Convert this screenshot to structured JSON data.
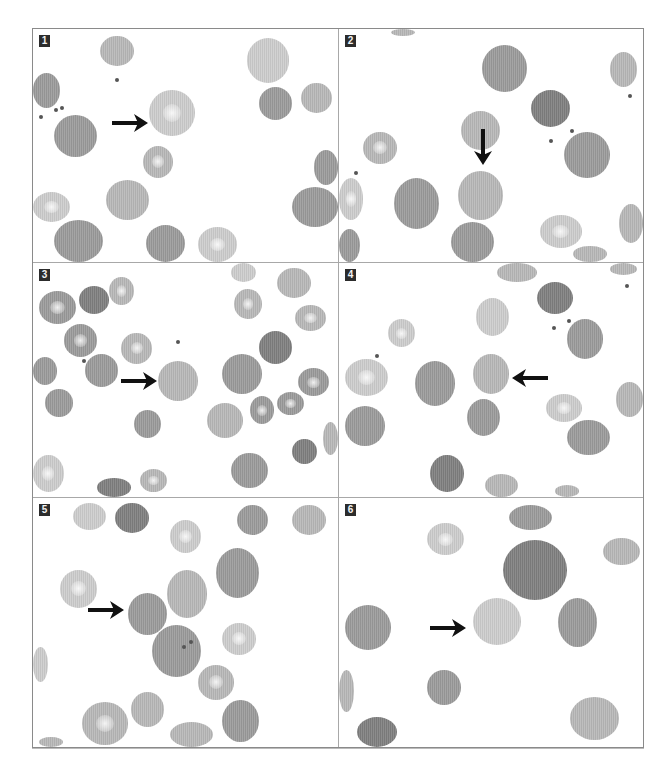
{
  "figure": {
    "panels": [
      {
        "label": "1",
        "arrow": {
          "direction": "right",
          "x": 26,
          "y": 36
        },
        "cells": [
          {
            "x": 22,
            "y": 3,
            "w": 11,
            "h": 13,
            "tone": "c-light"
          },
          {
            "x": 0,
            "y": 19,
            "w": 9,
            "h": 15,
            "tone": "c-mid"
          },
          {
            "x": 7,
            "y": 37,
            "w": 14,
            "h": 18,
            "tone": "c-mid"
          },
          {
            "x": 38,
            "y": 26,
            "w": 15,
            "h": 20,
            "tone": "c-pale",
            "pallor": true
          },
          {
            "x": 36,
            "y": 50,
            "w": 10,
            "h": 14,
            "tone": "c-light",
            "pallor": true
          },
          {
            "x": 24,
            "y": 65,
            "w": 14,
            "h": 17,
            "tone": "c-light"
          },
          {
            "x": 0,
            "y": 70,
            "w": 12,
            "h": 13,
            "tone": "c-pale",
            "pallor": true
          },
          {
            "x": 7,
            "y": 82,
            "w": 16,
            "h": 18,
            "tone": "c-mid"
          },
          {
            "x": 37,
            "y": 84,
            "w": 13,
            "h": 16,
            "tone": "c-mid"
          },
          {
            "x": 54,
            "y": 85,
            "w": 13,
            "h": 15,
            "tone": "c-pale",
            "pallor": true
          },
          {
            "x": 70,
            "y": 4,
            "w": 14,
            "h": 19,
            "tone": "c-pale"
          },
          {
            "x": 74,
            "y": 25,
            "w": 11,
            "h": 14,
            "tone": "c-mid"
          },
          {
            "x": 88,
            "y": 23,
            "w": 10,
            "h": 13,
            "tone": "c-light"
          },
          {
            "x": 92,
            "y": 52,
            "w": 8,
            "h": 15,
            "tone": "c-mid"
          },
          {
            "x": 85,
            "y": 68,
            "w": 15,
            "h": 17,
            "tone": "c-mid"
          }
        ],
        "debris": [
          {
            "x": 27,
            "y": 21
          },
          {
            "x": 7,
            "y": 34
          },
          {
            "x": 9,
            "y": 33
          },
          {
            "x": 2,
            "y": 37
          }
        ]
      },
      {
        "label": "2",
        "arrow": {
          "direction": "down",
          "x": 44,
          "y": 43
        },
        "cells": [
          {
            "x": 17,
            "y": 0,
            "w": 8,
            "h": 3,
            "tone": "c-light"
          },
          {
            "x": 47,
            "y": 7,
            "w": 15,
            "h": 20,
            "tone": "c-mid"
          },
          {
            "x": 89,
            "y": 10,
            "w": 9,
            "h": 15,
            "tone": "c-light"
          },
          {
            "x": 63,
            "y": 26,
            "w": 13,
            "h": 16,
            "tone": "c-dark"
          },
          {
            "x": 40,
            "y": 35,
            "w": 13,
            "h": 17,
            "tone": "c-light"
          },
          {
            "x": 74,
            "y": 44,
            "w": 15,
            "h": 20,
            "tone": "c-mid"
          },
          {
            "x": 8,
            "y": 44,
            "w": 11,
            "h": 14,
            "tone": "c-light",
            "pallor": true
          },
          {
            "x": 0,
            "y": 64,
            "w": 8,
            "h": 18,
            "tone": "c-pale",
            "pallor": true
          },
          {
            "x": 18,
            "y": 64,
            "w": 15,
            "h": 22,
            "tone": "c-mid"
          },
          {
            "x": 39,
            "y": 61,
            "w": 15,
            "h": 21,
            "tone": "c-light"
          },
          {
            "x": 37,
            "y": 83,
            "w": 14,
            "h": 17,
            "tone": "c-mid"
          },
          {
            "x": 0,
            "y": 86,
            "w": 7,
            "h": 14,
            "tone": "c-mid"
          },
          {
            "x": 66,
            "y": 80,
            "w": 14,
            "h": 14,
            "tone": "c-pale",
            "pallor": true
          },
          {
            "x": 77,
            "y": 93,
            "w": 11,
            "h": 7,
            "tone": "c-light"
          },
          {
            "x": 92,
            "y": 75,
            "w": 8,
            "h": 17,
            "tone": "c-light"
          }
        ],
        "debris": [
          {
            "x": 5,
            "y": 61
          },
          {
            "x": 95,
            "y": 28
          },
          {
            "x": 76,
            "y": 43
          },
          {
            "x": 69,
            "y": 47
          }
        ]
      },
      {
        "label": "3",
        "arrow": {
          "direction": "right",
          "x": 29,
          "y": 46
        },
        "cells": [
          {
            "x": 2,
            "y": 12,
            "w": 12,
            "h": 14,
            "tone": "c-mid",
            "pallor": true
          },
          {
            "x": 15,
            "y": 10,
            "w": 10,
            "h": 12,
            "tone": "c-dark"
          },
          {
            "x": 25,
            "y": 6,
            "w": 8,
            "h": 12,
            "tone": "c-light",
            "pallor": true
          },
          {
            "x": 10,
            "y": 26,
            "w": 11,
            "h": 14,
            "tone": "c-mid",
            "pallor": true
          },
          {
            "x": 29,
            "y": 30,
            "w": 10,
            "h": 13,
            "tone": "c-light",
            "pallor": true
          },
          {
            "x": 0,
            "y": 40,
            "w": 8,
            "h": 12,
            "tone": "c-mid"
          },
          {
            "x": 17,
            "y": 39,
            "w": 11,
            "h": 14,
            "tone": "c-mid"
          },
          {
            "x": 41,
            "y": 42,
            "w": 13,
            "h": 17,
            "tone": "c-light"
          },
          {
            "x": 4,
            "y": 54,
            "w": 9,
            "h": 12,
            "tone": "c-mid"
          },
          {
            "x": 33,
            "y": 63,
            "w": 9,
            "h": 12,
            "tone": "c-mid"
          },
          {
            "x": 0,
            "y": 82,
            "w": 10,
            "h": 16,
            "tone": "c-pale",
            "pallor": true
          },
          {
            "x": 21,
            "y": 92,
            "w": 11,
            "h": 8,
            "tone": "c-dark"
          },
          {
            "x": 35,
            "y": 88,
            "w": 9,
            "h": 10,
            "tone": "c-light",
            "pallor": true
          },
          {
            "x": 65,
            "y": 0,
            "w": 8,
            "h": 8,
            "tone": "c-pale"
          },
          {
            "x": 80,
            "y": 2,
            "w": 11,
            "h": 13,
            "tone": "c-light"
          },
          {
            "x": 66,
            "y": 11,
            "w": 9,
            "h": 13,
            "tone": "c-light",
            "pallor": true
          },
          {
            "x": 86,
            "y": 18,
            "w": 10,
            "h": 11,
            "tone": "c-light",
            "pallor": true
          },
          {
            "x": 74,
            "y": 29,
            "w": 11,
            "h": 14,
            "tone": "c-dark"
          },
          {
            "x": 62,
            "y": 39,
            "w": 13,
            "h": 17,
            "tone": "c-mid"
          },
          {
            "x": 87,
            "y": 45,
            "w": 10,
            "h": 12,
            "tone": "c-mid",
            "pallor": true
          },
          {
            "x": 57,
            "y": 60,
            "w": 12,
            "h": 15,
            "tone": "c-light"
          },
          {
            "x": 71,
            "y": 57,
            "w": 8,
            "h": 12,
            "tone": "c-mid",
            "pallor": true
          },
          {
            "x": 80,
            "y": 55,
            "w": 9,
            "h": 10,
            "tone": "c-mid",
            "pallor": true
          },
          {
            "x": 85,
            "y": 75,
            "w": 8,
            "h": 11,
            "tone": "c-dark"
          },
          {
            "x": 95,
            "y": 68,
            "w": 5,
            "h": 14,
            "tone": "c-light"
          },
          {
            "x": 65,
            "y": 81,
            "w": 12,
            "h": 15,
            "tone": "c-mid"
          }
        ],
        "debris": [
          {
            "x": 16,
            "y": 41
          },
          {
            "x": 47,
            "y": 33
          }
        ]
      },
      {
        "label": "4",
        "arrow": {
          "direction": "left",
          "x": 57,
          "y": 45
        },
        "cells": [
          {
            "x": 52,
            "y": 0,
            "w": 13,
            "h": 8,
            "tone": "c-light"
          },
          {
            "x": 89,
            "y": 0,
            "w": 9,
            "h": 5,
            "tone": "c-light"
          },
          {
            "x": 65,
            "y": 8,
            "w": 12,
            "h": 14,
            "tone": "c-dark"
          },
          {
            "x": 45,
            "y": 15,
            "w": 11,
            "h": 16,
            "tone": "c-pale"
          },
          {
            "x": 16,
            "y": 24,
            "w": 9,
            "h": 12,
            "tone": "c-pale",
            "pallor": true
          },
          {
            "x": 75,
            "y": 24,
            "w": 12,
            "h": 17,
            "tone": "c-mid"
          },
          {
            "x": 2,
            "y": 41,
            "w": 14,
            "h": 16,
            "tone": "c-pale",
            "pallor": true
          },
          {
            "x": 25,
            "y": 42,
            "w": 13,
            "h": 19,
            "tone": "c-mid"
          },
          {
            "x": 44,
            "y": 39,
            "w": 12,
            "h": 17,
            "tone": "c-light"
          },
          {
            "x": 42,
            "y": 58,
            "w": 11,
            "h": 16,
            "tone": "c-mid"
          },
          {
            "x": 2,
            "y": 61,
            "w": 13,
            "h": 17,
            "tone": "c-mid"
          },
          {
            "x": 68,
            "y": 56,
            "w": 12,
            "h": 12,
            "tone": "c-pale",
            "pallor": true
          },
          {
            "x": 75,
            "y": 67,
            "w": 14,
            "h": 15,
            "tone": "c-mid"
          },
          {
            "x": 91,
            "y": 51,
            "w": 9,
            "h": 15,
            "tone": "c-light"
          },
          {
            "x": 30,
            "y": 82,
            "w": 11,
            "h": 16,
            "tone": "c-dark"
          },
          {
            "x": 48,
            "y": 90,
            "w": 11,
            "h": 10,
            "tone": "c-light"
          },
          {
            "x": 71,
            "y": 95,
            "w": 8,
            "h": 5,
            "tone": "c-light"
          }
        ],
        "debris": [
          {
            "x": 12,
            "y": 39
          },
          {
            "x": 94,
            "y": 9
          },
          {
            "x": 75,
            "y": 24
          },
          {
            "x": 70,
            "y": 27
          }
        ]
      },
      {
        "label": "5",
        "arrow": {
          "direction": "right",
          "x": 18,
          "y": 41
        },
        "cells": [
          {
            "x": 13,
            "y": 2,
            "w": 11,
            "h": 11,
            "tone": "c-pale"
          },
          {
            "x": 27,
            "y": 2,
            "w": 11,
            "h": 12,
            "tone": "c-dark"
          },
          {
            "x": 45,
            "y": 9,
            "w": 10,
            "h": 13,
            "tone": "c-pale",
            "pallor": true
          },
          {
            "x": 67,
            "y": 3,
            "w": 10,
            "h": 12,
            "tone": "c-mid"
          },
          {
            "x": 85,
            "y": 3,
            "w": 11,
            "h": 12,
            "tone": "c-light"
          },
          {
            "x": 9,
            "y": 29,
            "w": 12,
            "h": 15,
            "tone": "c-pale",
            "pallor": true
          },
          {
            "x": 44,
            "y": 29,
            "w": 13,
            "h": 19,
            "tone": "c-light"
          },
          {
            "x": 60,
            "y": 20,
            "w": 14,
            "h": 20,
            "tone": "c-mid"
          },
          {
            "x": 31,
            "y": 38,
            "w": 13,
            "h": 17,
            "tone": "c-mid"
          },
          {
            "x": 39,
            "y": 51,
            "w": 16,
            "h": 21,
            "tone": "c-mid"
          },
          {
            "x": 62,
            "y": 50,
            "w": 11,
            "h": 13,
            "tone": "c-pale",
            "pallor": true
          },
          {
            "x": 0,
            "y": 60,
            "w": 5,
            "h": 14,
            "tone": "c-pale"
          },
          {
            "x": 54,
            "y": 67,
            "w": 12,
            "h": 14,
            "tone": "c-light",
            "pallor": true
          },
          {
            "x": 16,
            "y": 82,
            "w": 15,
            "h": 17,
            "tone": "c-light",
            "pallor": true
          },
          {
            "x": 32,
            "y": 78,
            "w": 11,
            "h": 14,
            "tone": "c-light"
          },
          {
            "x": 45,
            "y": 90,
            "w": 14,
            "h": 10,
            "tone": "c-light"
          },
          {
            "x": 62,
            "y": 81,
            "w": 12,
            "h": 17,
            "tone": "c-mid"
          },
          {
            "x": 2,
            "y": 96,
            "w": 8,
            "h": 4,
            "tone": "c-light"
          }
        ],
        "debris": [
          {
            "x": 51,
            "y": 57
          },
          {
            "x": 49,
            "y": 59
          }
        ]
      },
      {
        "label": "6",
        "arrow": {
          "direction": "right",
          "x": 30,
          "y": 48
        },
        "cells": [
          {
            "x": 29,
            "y": 10,
            "w": 12,
            "h": 13,
            "tone": "c-pale",
            "pallor": true
          },
          {
            "x": 56,
            "y": 3,
            "w": 14,
            "h": 10,
            "tone": "c-mid"
          },
          {
            "x": 54,
            "y": 17,
            "w": 21,
            "h": 24,
            "tone": "c-dark"
          },
          {
            "x": 87,
            "y": 16,
            "w": 12,
            "h": 11,
            "tone": "c-light"
          },
          {
            "x": 2,
            "y": 43,
            "w": 15,
            "h": 18,
            "tone": "c-mid"
          },
          {
            "x": 44,
            "y": 40,
            "w": 16,
            "h": 19,
            "tone": "c-pale"
          },
          {
            "x": 72,
            "y": 40,
            "w": 13,
            "h": 20,
            "tone": "c-mid"
          },
          {
            "x": 29,
            "y": 69,
            "w": 11,
            "h": 14,
            "tone": "c-mid"
          },
          {
            "x": 0,
            "y": 69,
            "w": 5,
            "h": 17,
            "tone": "c-light"
          },
          {
            "x": 6,
            "y": 88,
            "w": 13,
            "h": 12,
            "tone": "c-dark"
          },
          {
            "x": 76,
            "y": 80,
            "w": 16,
            "h": 17,
            "tone": "c-light"
          }
        ],
        "debris": []
      }
    ]
  }
}
